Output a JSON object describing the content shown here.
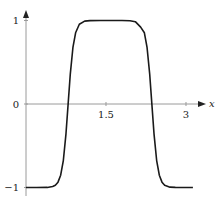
{
  "chart_data": {
    "type": "line",
    "title": "",
    "xlabel": "x",
    "ylabel": "",
    "xlim": [
      0,
      3.2
    ],
    "ylim": [
      -1,
      1
    ],
    "grid": false,
    "legend": null,
    "x_ticks": [
      {
        "value": 1.5,
        "label": "1.5"
      },
      {
        "value": 3,
        "label": "3"
      }
    ],
    "y_ticks": [
      {
        "value": 1,
        "label": "1"
      },
      {
        "value": 0,
        "label": "0"
      },
      {
        "value": -1,
        "label": "−1"
      }
    ],
    "series": [
      {
        "name": "f(x)",
        "color": "#1a1a1a",
        "x": [
          0,
          0.2,
          0.4,
          0.5,
          0.55,
          0.6,
          0.65,
          0.7,
          0.75,
          0.79,
          0.83,
          0.88,
          0.93,
          1.0,
          1.1,
          1.2,
          1.4,
          1.6,
          1.8,
          1.95,
          2.05,
          2.15,
          2.22,
          2.27,
          2.32,
          2.36,
          2.4,
          2.45,
          2.5,
          2.55,
          2.6,
          2.7,
          2.8,
          3.0,
          3.13
        ],
        "y": [
          -1,
          -1,
          -0.999,
          -0.989,
          -0.974,
          -0.936,
          -0.853,
          -0.677,
          -0.354,
          0,
          0.354,
          0.677,
          0.853,
          0.955,
          0.992,
          0.999,
          1,
          1,
          1,
          0.997,
          0.986,
          0.92,
          0.853,
          0.677,
          0.354,
          0,
          -0.354,
          -0.677,
          -0.853,
          -0.936,
          -0.974,
          -0.996,
          -0.999,
          -1,
          -1
        ]
      }
    ]
  },
  "axes": {
    "x_axis_label": "x",
    "y_tick_labels": [
      "1",
      "0",
      "−1"
    ],
    "x_tick_labels": [
      "1.5",
      "3"
    ]
  }
}
